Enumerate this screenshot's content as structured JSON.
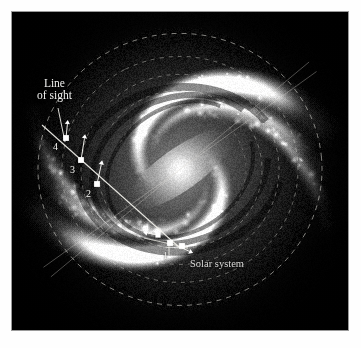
{
  "figure": {
    "kind": "galaxy-diagram",
    "frame_border_color": "#9a9a9a",
    "plate_background": "#020202",
    "label_color": "#f2f2f0"
  },
  "labels": {
    "line_of_sight": "Line\nof sight",
    "line_of_sight_line1": "Line",
    "line_of_sight_line2": "of sight",
    "solar_system": "Solar system"
  },
  "markers": [
    {
      "id": "1",
      "label": "1",
      "x": 158,
      "y": 231,
      "has_arrow": true,
      "arrow_dir": "down-right"
    },
    {
      "id": "2",
      "label": "2",
      "x": 85,
      "y": 172,
      "has_arrow": true,
      "arrow_dir": "up"
    },
    {
      "id": "3",
      "label": "3",
      "x": 69,
      "y": 148,
      "has_arrow": true,
      "arrow_dir": "up"
    },
    {
      "id": "4",
      "label": "4",
      "x": 54,
      "y": 126,
      "has_arrow": true,
      "arrow_dir": "up"
    },
    {
      "id": "sun",
      "label": "",
      "x": 146,
      "y": 223,
      "has_arrow": true,
      "arrow_dir": "left"
    },
    {
      "id": "sun-b",
      "label": "",
      "x": 170,
      "y": 234,
      "has_arrow": false,
      "arrow_dir": ""
    }
  ],
  "chart_data": {
    "type": "scatter",
    "title": "",
    "xlabel": "",
    "ylabel": "",
    "annotations": [
      "Line of sight",
      "Solar system",
      "1",
      "2",
      "3",
      "4"
    ],
    "series": [
      {
        "name": "line-of-sight clouds",
        "points": [
          {
            "label": "1",
            "x": 158,
            "y": 231
          },
          {
            "label": "2",
            "x": 85,
            "y": 172
          },
          {
            "label": "3",
            "x": 69,
            "y": 148
          },
          {
            "label": "4",
            "x": 54,
            "y": 126
          }
        ]
      }
    ],
    "guides": {
      "dashed_rings": 5,
      "sight_line": {
        "x1": 168,
        "y1": 236,
        "x2": 36,
        "y2": 118
      }
    }
  }
}
